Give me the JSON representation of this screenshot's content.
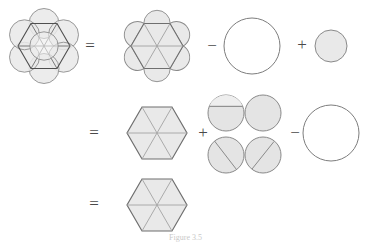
{
  "figure": {
    "caption": "Figure 3.5",
    "palette": {
      "fill_light": "#ebebeb",
      "fill_shape": "#e6e6e6",
      "stroke_dark": "#5b5b5b",
      "stroke_mid": "#8f8f8f",
      "stroke_light": "#b4b4b4",
      "white": "#ffffff",
      "background": "#ffffff",
      "sign_color": "#4a4a4a"
    },
    "rows": [
      {
        "id": "row-1",
        "equals_label": "=",
        "terms": [
          {
            "id": "rosette-figure",
            "name": "rosette-overlapping-circles",
            "operator": "",
            "shape": "rosette",
            "description": "Hexagon with three long diagonals, six petal circles on the edges and one central circle"
          },
          {
            "id": "hexagon-with-bumps",
            "name": "hexagon-with-six-circular-bumps",
            "operator": "=",
            "shape": "hexagon_bumps",
            "description": "Shaded hexagon with internal diagonals and six outward circular segments"
          },
          {
            "id": "large-empty-circle-1",
            "name": "unfilled-large-circle",
            "operator": "−",
            "shape": "circle_empty",
            "description": "Large unfilled circle"
          },
          {
            "id": "small-filled-circle-1",
            "name": "filled-small-circle",
            "operator": "+",
            "shape": "circle_filled",
            "description": "Small shaded circle"
          }
        ]
      },
      {
        "id": "row-2",
        "equals_label": "=",
        "terms": [
          {
            "id": "hexagon-plain-2",
            "name": "hexagon-with-diagonals",
            "operator": "=",
            "shape": "hexagon_plain",
            "description": "Shaded hexagon with three diagonals"
          },
          {
            "id": "four-chord-circles",
            "name": "grid-of-four-chord-circles",
            "operator": "+",
            "shape": "circle_grid",
            "description": "Two by two grid of shaded circles with chords",
            "cells": [
              {
                "id": "cell-top-left",
                "name": "circle-horizontal-chord",
                "chord": "horizontal"
              },
              {
                "id": "cell-top-right",
                "name": "circle-no-chord",
                "chord": "none"
              },
              {
                "id": "cell-bottom-left",
                "name": "circle-diagonal-chord-backslash",
                "chord": "backslash"
              },
              {
                "id": "cell-bottom-right",
                "name": "circle-diagonal-chord-slash",
                "chord": "slash"
              }
            ]
          },
          {
            "id": "large-empty-circle-2",
            "name": "unfilled-large-circle",
            "operator": "−",
            "shape": "circle_empty",
            "description": "Large unfilled circle"
          }
        ]
      },
      {
        "id": "row-3",
        "equals_label": "=",
        "terms": [
          {
            "id": "hexagon-plain-3",
            "name": "hexagon-with-diagonals",
            "operator": "=",
            "shape": "hexagon_plain",
            "description": "Shaded hexagon with three diagonals"
          }
        ]
      }
    ],
    "signs": {
      "row1_equals": "=",
      "row1_minus": "−",
      "row1_plus": "+",
      "row2_equals": "=",
      "row2_plus": "+",
      "row2_minus": "−",
      "row3_equals": "="
    }
  }
}
